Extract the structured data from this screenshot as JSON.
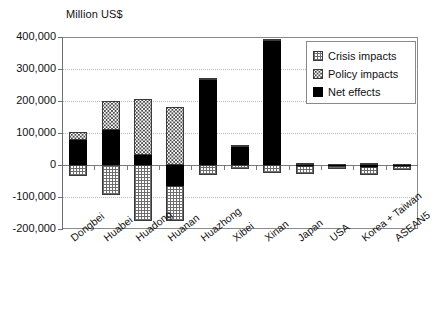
{
  "chart_data": {
    "type": "bar",
    "title": "Million US$",
    "xlabel": "",
    "ylabel": "Million US$",
    "ylim": [
      -200000,
      400000
    ],
    "ytick_step": 100000,
    "ytick_labels": [
      "400,000",
      "300,000",
      "200,000",
      "100,000",
      "0",
      "-100,000",
      "-200,000"
    ],
    "ytick_values": [
      400000,
      300000,
      200000,
      100000,
      0,
      -100000,
      -200000
    ],
    "grid": true,
    "stacked": true,
    "legend_position": "upper-right",
    "categories": [
      "Dongbei",
      "Huabei",
      "Huadong",
      "Huanan",
      "Huazhong",
      "Xibei",
      "Xinan",
      "Japan",
      "USA",
      "Korea + Taiwan",
      "ASEAN5"
    ],
    "series": [
      {
        "name": "Crisis impacts",
        "pattern": "grid-hatch",
        "color": "#ffffff",
        "values": [
          -35000,
          -95000,
          -175000,
          -175000,
          -32000,
          -12000,
          -25000,
          -28000,
          -14000,
          -30000,
          -15000
        ]
      },
      {
        "name": "Policy impacts",
        "pattern": "dotted",
        "color": "#ffffff",
        "values": [
          25000,
          92000,
          175000,
          180000,
          7000,
          8000,
          6000,
          6000,
          3000,
          7000,
          3000
        ]
      },
      {
        "name": "Net effects",
        "pattern": "solid",
        "color": "#000000",
        "values": [
          78000,
          108000,
          30000,
          -65000,
          265000,
          55000,
          388000,
          -4000,
          -3000,
          -6000,
          -4000
        ]
      }
    ]
  },
  "legend": {
    "items": [
      {
        "label": "Crisis impacts",
        "swatch": "crisis"
      },
      {
        "label": "Policy impacts",
        "swatch": "policy"
      },
      {
        "label": "Net effects",
        "swatch": "net"
      }
    ]
  }
}
